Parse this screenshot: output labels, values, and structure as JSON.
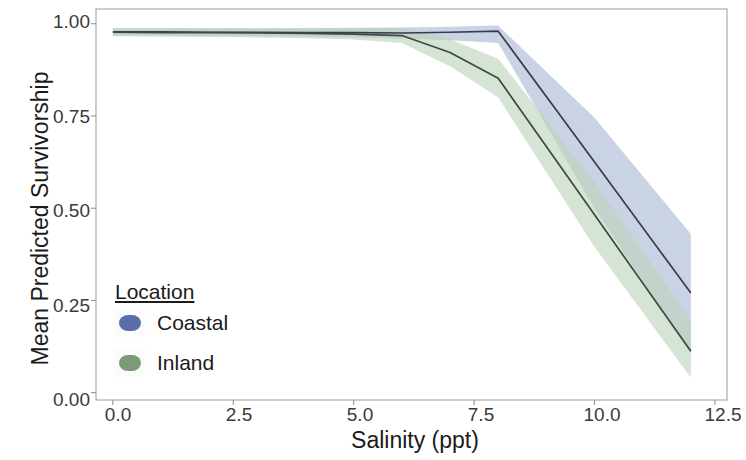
{
  "chart_data": {
    "type": "line",
    "title": "",
    "subtitle": "",
    "xlabel": "Salinity (ppt)",
    "ylabel": "Mean Predicted Survivorship",
    "xlim": [
      -0.35,
      12.75
    ],
    "ylim": [
      -0.02,
      1.04
    ],
    "xticks": [
      0.0,
      2.5,
      5.0,
      7.5,
      10.0,
      12.5
    ],
    "xticklabels": [
      "0.0",
      "2.5",
      "5.0",
      "7.5",
      "10.0",
      "12.5"
    ],
    "yticks": [
      0.0,
      0.25,
      0.5,
      0.75,
      1.0
    ],
    "yticklabels": [
      "0.00",
      "0.25",
      "0.50",
      "0.75",
      "1.00"
    ],
    "grid": false,
    "legend": {
      "title": "Location",
      "position": "inside-lower-left",
      "entries": [
        "Coastal",
        "Inland"
      ]
    },
    "bands": "95% confidence ribbons shaded around each mean line",
    "series": [
      {
        "name": "Coastal",
        "color": "#5a6fa8",
        "line_color": "#3b3b4e",
        "ribbon_color": "#aab8d4",
        "x": [
          0,
          1,
          2,
          3,
          4,
          5,
          6,
          7,
          8,
          10,
          12
        ],
        "y": [
          0.978,
          0.978,
          0.977,
          0.977,
          0.976,
          0.976,
          0.975,
          0.977,
          0.98,
          0.625,
          0.27
        ],
        "y_lower": [
          0.968,
          0.968,
          0.967,
          0.966,
          0.965,
          0.963,
          0.96,
          0.955,
          0.948,
          0.5,
          0.105
        ],
        "y_upper": [
          0.988,
          0.988,
          0.988,
          0.988,
          0.988,
          0.989,
          0.99,
          0.992,
          0.995,
          0.745,
          0.43
        ]
      },
      {
        "name": "Inland",
        "color": "#7a9b76",
        "line_color": "#3d4a3d",
        "ribbon_color": "#bcd4bb",
        "x": [
          0,
          1,
          2,
          3,
          4,
          5,
          6,
          7,
          8,
          10,
          12
        ],
        "y": [
          0.977,
          0.976,
          0.976,
          0.975,
          0.974,
          0.972,
          0.968,
          0.922,
          0.852,
          0.482,
          0.112
        ],
        "y_lower": [
          0.966,
          0.965,
          0.964,
          0.963,
          0.961,
          0.957,
          0.948,
          0.885,
          0.8,
          0.395,
          0.04
        ],
        "y_upper": [
          0.988,
          0.988,
          0.988,
          0.988,
          0.988,
          0.988,
          0.988,
          0.958,
          0.905,
          0.572,
          0.195
        ]
      }
    ]
  },
  "colors": {
    "coastal": "#5a6fa8",
    "inland": "#7a9b76",
    "axis": "#8a8a8a",
    "text": "#1b1b1b",
    "tick_text": "#3a3a3a",
    "panel_background": "#ffffff"
  }
}
